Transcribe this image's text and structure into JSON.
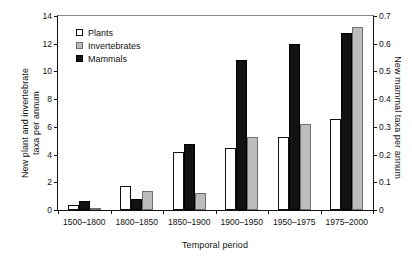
{
  "chart_data": {
    "type": "bar",
    "title": "",
    "xlabel": "Temporal period",
    "ylabel": "New plant and invertebrate taxa per annum",
    "ylabel_line1": "New plant and invertebrate",
    "ylabel_line2": "taxa per annum",
    "ylabel_right": "New mammal taxa per annum",
    "categories": [
      "1500–1800",
      "1800–1850",
      "1850–1900",
      "1900–1950",
      "1950–1975",
      "1975–2000"
    ],
    "series": [
      {
        "name": "Plants",
        "axis": "left",
        "color": "#ffffff",
        "values": [
          0.35,
          1.7,
          4.2,
          4.5,
          5.3,
          6.6
        ]
      },
      {
        "name": "Invertebrates",
        "axis": "left",
        "color": "#bcbcbc",
        "values": [
          0.05,
          1.4,
          1.2,
          5.3,
          6.2,
          13.2
        ]
      },
      {
        "name": "Mammals",
        "axis": "right",
        "color": "#121212",
        "values": [
          0.031,
          0.041,
          0.24,
          0.54,
          0.6,
          0.64
        ]
      }
    ],
    "bar_order": [
      [
        "Plants",
        "Mammals",
        "Invertebrates"
      ],
      [
        "Plants",
        "Mammals",
        "Invertebrates"
      ],
      [
        "Plants",
        "Mammals",
        "Invertebrates"
      ],
      [
        "Plants",
        "Mammals",
        "Invertebrates"
      ],
      [
        "Plants",
        "Mammals",
        "Invertebrates"
      ],
      [
        "Plants",
        "Mammals",
        "Invertebrates"
      ]
    ],
    "ylim": [
      0,
      14
    ],
    "yticks": [
      0,
      2,
      4,
      6,
      8,
      10,
      12,
      14
    ],
    "ylim_right": [
      0,
      0.7
    ],
    "yticks_right": [
      "0",
      "0.1",
      "0.2",
      "0.3",
      "0.4",
      "0.5",
      "0.6",
      "0.7"
    ],
    "ytick_values_right": [
      0,
      0.1,
      0.2,
      0.3,
      0.4,
      0.5,
      0.6,
      0.7
    ],
    "grid": false,
    "legend_position": "upper left",
    "legend": [
      "Plants",
      "Invertebrates",
      "Mammals"
    ]
  }
}
